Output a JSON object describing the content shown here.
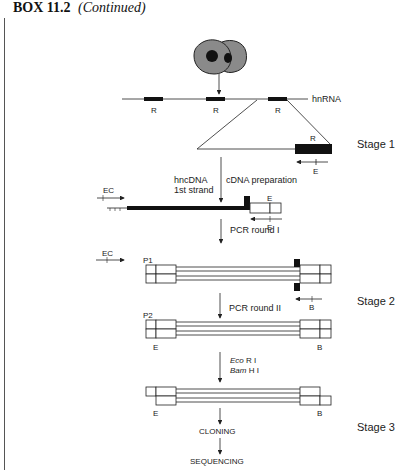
{
  "header": {
    "box_number": "BOX 11.2",
    "continued": "(Continued)"
  },
  "diagram": {
    "hnrna_label": "hnRNA",
    "exon_label": "R",
    "stages": [
      "Stage 1",
      "Stage 2",
      "Stage 3"
    ],
    "hnc_dna_label": "hncDNA",
    "first_strand_label": "1st strand",
    "cdna_prep_label": "cDNA preparation",
    "ec_label": "EC",
    "e_label": "E",
    "b_label": "B",
    "p1_label": "P1",
    "p2_label": "P2",
    "pcr_round_1": "PCR round I",
    "pcr_round_2": "PCR round II",
    "eco_label": "Eco",
    "eco_rest": " R I",
    "bam_label": "Bam",
    "bam_rest": " H I",
    "cloning_label": "CLONING",
    "sequencing_label": "SEQUENCING"
  }
}
